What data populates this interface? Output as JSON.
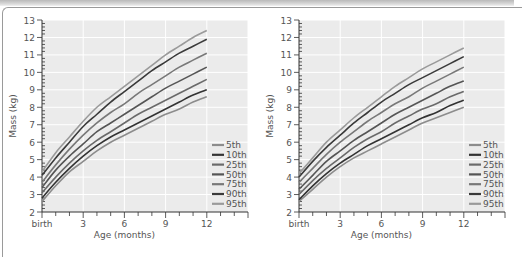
{
  "chart_data": [
    {
      "type": "line",
      "title": "",
      "xlabel": "Age (months)",
      "ylabel": "Mass (kg)",
      "xlim": [
        0,
        15
      ],
      "ylim": [
        2,
        13
      ],
      "x_ticks": [
        {
          "value": 0,
          "label": "birth"
        },
        {
          "value": 3,
          "label": "3"
        },
        {
          "value": 6,
          "label": "6"
        },
        {
          "value": 9,
          "label": "9"
        },
        {
          "value": 12,
          "label": "12"
        }
      ],
      "y_ticks": [
        2,
        3,
        4,
        5,
        6,
        7,
        8,
        9,
        10,
        11,
        12,
        13
      ],
      "grid": true,
      "legend_position": "bottom-right",
      "x": [
        0,
        1,
        2,
        3,
        4,
        5,
        6,
        7,
        8,
        9,
        10,
        11,
        12
      ],
      "series": [
        {
          "name": "5th",
          "color": "#8c8c8c",
          "values": [
            2.6,
            3.5,
            4.3,
            4.9,
            5.5,
            6.0,
            6.4,
            6.8,
            7.2,
            7.6,
            7.9,
            8.3,
            8.6
          ]
        },
        {
          "name": "10th",
          "color": "#333333",
          "values": [
            2.8,
            3.7,
            4.5,
            5.2,
            5.8,
            6.3,
            6.7,
            7.1,
            7.5,
            7.9,
            8.3,
            8.7,
            9.0
          ]
        },
        {
          "name": "25th",
          "color": "#6a6a6a",
          "values": [
            3.1,
            4.0,
            4.8,
            5.5,
            6.1,
            6.6,
            7.1,
            7.6,
            8.0,
            8.4,
            8.8,
            9.2,
            9.6
          ]
        },
        {
          "name": "50th",
          "color": "#555555",
          "values": [
            3.4,
            4.4,
            5.2,
            5.9,
            6.6,
            7.1,
            7.6,
            8.1,
            8.6,
            9.1,
            9.5,
            9.9,
            10.3
          ]
        },
        {
          "name": "75th",
          "color": "#787878",
          "values": [
            3.7,
            4.7,
            5.6,
            6.4,
            7.1,
            7.7,
            8.2,
            8.8,
            9.3,
            9.8,
            10.3,
            10.7,
            11.1
          ]
        },
        {
          "name": "90th",
          "color": "#3a3a3a",
          "values": [
            4.1,
            5.1,
            6.0,
            6.9,
            7.6,
            8.3,
            8.9,
            9.5,
            10.1,
            10.6,
            11.1,
            11.5,
            11.9
          ]
        },
        {
          "name": "95th",
          "color": "#9a9a9a",
          "values": [
            4.3,
            5.4,
            6.3,
            7.2,
            8.0,
            8.6,
            9.2,
            9.8,
            10.4,
            11.0,
            11.5,
            12.0,
            12.4
          ]
        }
      ]
    },
    {
      "type": "line",
      "title": "",
      "xlabel": "Age (months)",
      "ylabel": "Mass (kg)",
      "xlim": [
        0,
        15
      ],
      "ylim": [
        2,
        13
      ],
      "x_ticks": [
        {
          "value": 0,
          "label": "birth"
        },
        {
          "value": 3,
          "label": "3"
        },
        {
          "value": 6,
          "label": "6"
        },
        {
          "value": 9,
          "label": "9"
        },
        {
          "value": 12,
          "label": "12"
        }
      ],
      "y_ticks": [
        2,
        3,
        4,
        5,
        6,
        7,
        8,
        9,
        10,
        11,
        12,
        13
      ],
      "grid": true,
      "legend_position": "bottom-right",
      "x": [
        0,
        1,
        2,
        3,
        4,
        5,
        6,
        7,
        8,
        9,
        10,
        11,
        12
      ],
      "series": [
        {
          "name": "5th",
          "color": "#8c8c8c",
          "values": [
            2.6,
            3.3,
            4.0,
            4.6,
            5.1,
            5.5,
            5.9,
            6.3,
            6.7,
            7.1,
            7.4,
            7.7,
            8.0
          ]
        },
        {
          "name": "10th",
          "color": "#333333",
          "values": [
            2.7,
            3.5,
            4.2,
            4.8,
            5.3,
            5.8,
            6.2,
            6.6,
            7.0,
            7.4,
            7.7,
            8.1,
            8.4
          ]
        },
        {
          "name": "25th",
          "color": "#6a6a6a",
          "values": [
            3.0,
            3.8,
            4.5,
            5.1,
            5.7,
            6.2,
            6.6,
            7.1,
            7.5,
            7.9,
            8.2,
            8.6,
            8.9
          ]
        },
        {
          "name": "50th",
          "color": "#555555",
          "values": [
            3.3,
            4.1,
            4.9,
            5.5,
            6.1,
            6.6,
            7.1,
            7.6,
            8.0,
            8.4,
            8.8,
            9.2,
            9.5
          ]
        },
        {
          "name": "75th",
          "color": "#787878",
          "values": [
            3.7,
            4.5,
            5.3,
            6.0,
            6.6,
            7.2,
            7.7,
            8.2,
            8.6,
            9.1,
            9.5,
            9.9,
            10.3
          ]
        },
        {
          "name": "90th",
          "color": "#3a3a3a",
          "values": [
            4.0,
            4.9,
            5.7,
            6.4,
            7.1,
            7.7,
            8.3,
            8.8,
            9.3,
            9.7,
            10.1,
            10.5,
            10.9
          ]
        },
        {
          "name": "95th",
          "color": "#9a9a9a",
          "values": [
            4.2,
            5.1,
            6.0,
            6.7,
            7.4,
            8.0,
            8.6,
            9.2,
            9.7,
            10.2,
            10.6,
            11.0,
            11.4
          ]
        }
      ]
    }
  ]
}
